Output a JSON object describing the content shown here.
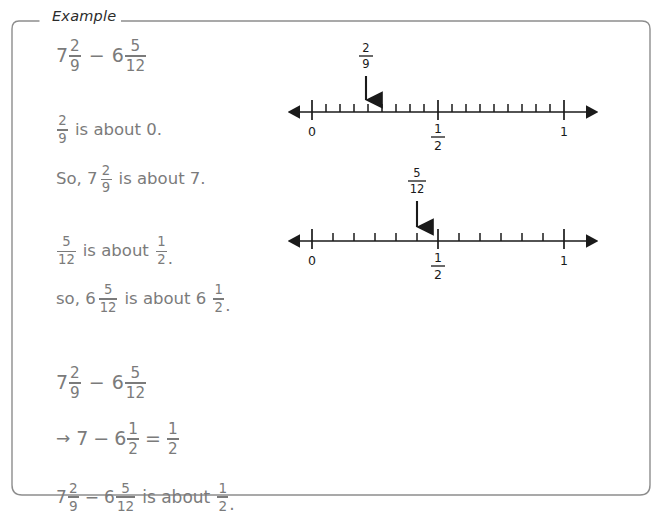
{
  "frame": {
    "label": "Example"
  },
  "solution": {
    "problem": {
      "whole_a": "7",
      "num_a": "2",
      "den_a": "9",
      "operator": "−",
      "whole_b": "6",
      "num_b": "5",
      "den_b": "12"
    },
    "step1": {
      "line1": {
        "num": "2",
        "den": "9",
        "text": "is about 0."
      },
      "line2": {
        "lead": "So, 7",
        "num": "2",
        "den": "9",
        "text": "is about 7."
      }
    },
    "step2": {
      "line1": {
        "num": "5",
        "den": "12",
        "text_mid": "is about",
        "res_num": "1",
        "res_den": "2",
        "period": "."
      },
      "line2": {
        "lead": "so, 6",
        "num": "5",
        "den": "12",
        "text_mid": "is about 6",
        "res_num": "1",
        "res_den": "2",
        "period": "."
      }
    },
    "step3": {
      "line1": {
        "whole_a": "7",
        "num_a": "2",
        "den_a": "9",
        "operator": "−",
        "whole_b": "6",
        "num_b": "5",
        "den_b": "12"
      },
      "line2": {
        "arrow": "→",
        "whole_a": "7",
        "operator": "−",
        "whole_b": "6",
        "num_b": "1",
        "den_b": "2",
        "equals": "=",
        "res_num": "1",
        "res_den": "2"
      },
      "line3": {
        "whole_a": "7",
        "num_a": "2",
        "den_a": "9",
        "operator": "−",
        "whole_b": "6",
        "num_b": "5",
        "den_b": "12",
        "text_mid": "is about",
        "res_num": "1",
        "res_den": "2",
        "period": "."
      }
    }
  },
  "numberlines": [
    {
      "id": "numberline-two-ninths",
      "pointer_num": "2",
      "pointer_den": "9",
      "pointer_value": 0.2222,
      "divisions": 18,
      "ticks": [
        {
          "label": "0",
          "value": 0
        },
        {
          "label_num": "1",
          "label_den": "2",
          "value": 0.5
        },
        {
          "label": "1",
          "value": 1
        }
      ]
    },
    {
      "id": "numberline-five-twelfths",
      "pointer_num": "5",
      "pointer_den": "12",
      "pointer_value": 0.4167,
      "divisions": 12,
      "ticks": [
        {
          "label": "0",
          "value": 0
        },
        {
          "label_num": "1",
          "label_den": "2",
          "value": 0.5
        },
        {
          "label": "1",
          "value": 1
        }
      ]
    }
  ],
  "colors": {
    "frame_stroke": "#8d8d8d",
    "solution_text": "#7b7b7b",
    "label_text": "#2b2b2b",
    "numberline_stroke": "#1a1a1a"
  }
}
